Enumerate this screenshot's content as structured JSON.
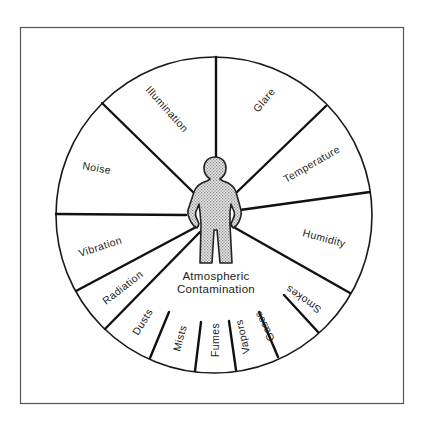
{
  "diagram": {
    "center_label_line1": "Atmospheric",
    "center_label_line2": "Contamination",
    "center_icon": "human-figure-icon",
    "segments": [
      {
        "label": "Illumination"
      },
      {
        "label": "Glare"
      },
      {
        "label": "Temperature"
      },
      {
        "label": "Humidity"
      },
      {
        "label": "Noise"
      },
      {
        "label": "Vibration"
      },
      {
        "label": "Radiation"
      }
    ],
    "contamination_subsegments": [
      {
        "label": "Dusts"
      },
      {
        "label": "Mists"
      },
      {
        "label": "Fumes"
      },
      {
        "label": "Vapors"
      },
      {
        "label": "Gases"
      },
      {
        "label": "Smokes"
      }
    ],
    "colors": {
      "line": "#111111",
      "figure_fill": "#c8c8c8",
      "background": "#ffffff"
    }
  }
}
